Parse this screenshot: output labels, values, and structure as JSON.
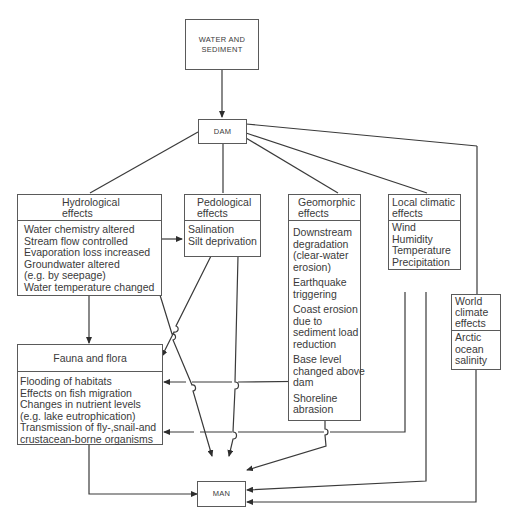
{
  "diagram": {
    "source": {
      "label_line1": "WATER AND",
      "label_line2": "SEDIMENT"
    },
    "dam": {
      "label": "DAM"
    },
    "man": {
      "label": "MAN"
    },
    "hydrological": {
      "title_line1": "Hydrological",
      "title_line2": "effects",
      "items": [
        "Water chemistry altered",
        "Stream flow controlled",
        "Evaporation loss increased",
        "Groundwater altered",
        "(e.g. by seepage)",
        "Water temperature changed"
      ]
    },
    "pedological": {
      "title_line1": "Pedological",
      "title_line2": "effects",
      "items": [
        "Salination",
        "Silt deprivation"
      ]
    },
    "geomorphic": {
      "title_line1": "Geomorphic",
      "title_line2": "effects",
      "groups": [
        [
          "Downstream",
          "degradation",
          "(clear-water",
          "erosion)"
        ],
        [
          "Earthquake",
          "triggering"
        ],
        [
          "Coast erosion",
          "due to",
          "sediment load",
          "reduction"
        ],
        [
          "Base level",
          "changed above",
          "dam"
        ],
        [
          "Shoreline",
          "abrasion"
        ]
      ]
    },
    "local_climatic": {
      "title_line1": "Local climatic",
      "title_line2": "effects",
      "items": [
        "Wind",
        "Humidity",
        "Temperature",
        "Precipitation"
      ]
    },
    "world_climate": {
      "title_lines": [
        "World",
        "climate",
        "effects"
      ],
      "items": [
        "Arctic",
        "ocean",
        "salinity"
      ]
    },
    "fauna_flora": {
      "title": "Fauna and flora",
      "items": [
        "Flooding of habitats",
        "Effects on fish migration",
        "Changes in nutrient levels",
        "(e.g. lake eutrophication)",
        "Transmission of fly-,snail-and",
        "crustacean-borne organisms"
      ]
    },
    "colors": {
      "line": "#3a3a3a",
      "box_border": "#5a5a5a",
      "background": "#ffffff"
    }
  }
}
